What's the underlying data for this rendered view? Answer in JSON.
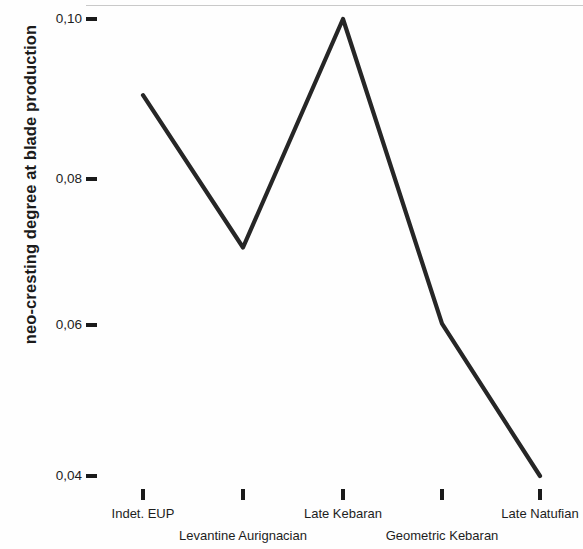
{
  "figure": {
    "background_color": "#fefefe",
    "line_color": "#262626",
    "text_color": "#1d1d1d",
    "tick_color": "#1a1a1a"
  },
  "axes": {
    "y_title": "neo-cresting degree at blade production",
    "y_ticklabels": [
      "0,10",
      "0,08",
      "0,06",
      "0,04"
    ],
    "x_ticklabels": [
      "Indet. EUP",
      "Levantine Aurignacian",
      "Late Kebaran",
      "Geometric Kebaran",
      "Late Natufian"
    ]
  },
  "chart_data": {
    "type": "line",
    "title": "",
    "subtitle": "",
    "xlabel": "",
    "ylabel": "neo-cresting degree at blade production",
    "categories": [
      "Indet. EUP",
      "Levantine Aurignacian",
      "Late Kebaran",
      "Geometric Kebaran",
      "Late Natufian"
    ],
    "values": [
      0.09,
      0.07,
      0.1,
      0.06,
      0.04
    ],
    "value_labels": [
      "0,09",
      "0,07",
      "0,10",
      "0,06",
      "0,04"
    ],
    "ytick_values": [
      0.1,
      0.08,
      0.06,
      0.04
    ],
    "ytick_labels": [
      "0,10",
      "0,08",
      "0,06",
      "0,04"
    ],
    "ylim": [
      0.0335,
      0.1022
    ],
    "decimal_separator": ",",
    "grid": false,
    "legend": false,
    "legend_position": "none",
    "series": [
      {
        "name": "neo-cresting degree at blade production",
        "values": [
          0.09,
          0.07,
          0.1,
          0.06,
          0.04
        ]
      }
    ],
    "annotations": []
  }
}
